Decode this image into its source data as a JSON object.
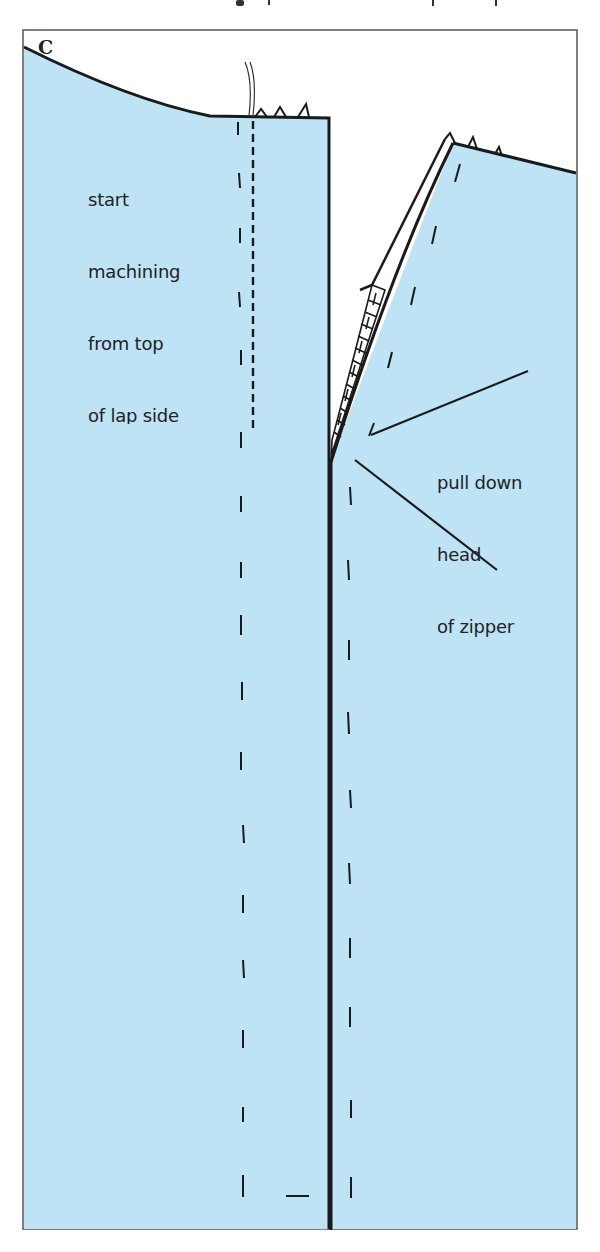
{
  "figure": {
    "panel_label": "C",
    "annotations": {
      "left": {
        "lines": [
          "start",
          "machining",
          "from top",
          "of lap side"
        ]
      },
      "right": {
        "lines": [
          "pull down",
          "head",
          "of zipper"
        ]
      }
    },
    "colors": {
      "fabric": "#bde3f5",
      "outline": "#1a1a1a",
      "frame": "#555555",
      "background": "#ffffff"
    }
  }
}
